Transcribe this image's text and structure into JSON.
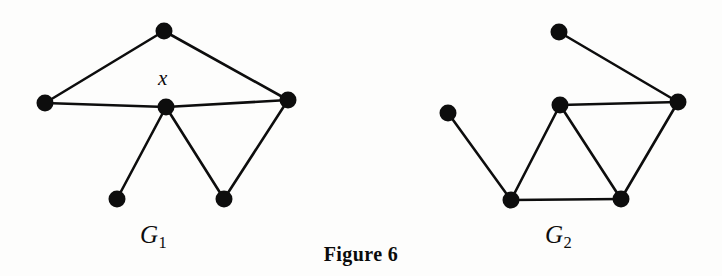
{
  "figure": {
    "caption": "Figure 6",
    "background_color": "#fdfdfc",
    "ink_color": "#0d0d0d",
    "width": 722,
    "height": 276
  },
  "graphs": [
    {
      "id": "G1",
      "label": "G",
      "label_subscript": "1",
      "label_x": 140,
      "label_y": 222,
      "vertex_radius": 8.5,
      "edge_width": 2.6,
      "vertices": [
        {
          "id": "g1-top",
          "name": "top-vertex",
          "x": 164,
          "y": 31,
          "label": ""
        },
        {
          "id": "g1-left",
          "name": "left-vertex",
          "x": 45,
          "y": 103,
          "label": ""
        },
        {
          "id": "g1-center",
          "name": "center-vertex-x",
          "x": 166,
          "y": 107,
          "label": "x"
        },
        {
          "id": "g1-right",
          "name": "right-vertex",
          "x": 288,
          "y": 100,
          "label": ""
        },
        {
          "id": "g1-bottom-left",
          "name": "bottom-left-vertex",
          "x": 117,
          "y": 199,
          "label": ""
        },
        {
          "id": "g1-bottom-right",
          "name": "bottom-right-vertex",
          "x": 224,
          "y": 199,
          "label": ""
        }
      ],
      "edges": [
        {
          "from": "g1-top",
          "to": "g1-left"
        },
        {
          "from": "g1-top",
          "to": "g1-right"
        },
        {
          "from": "g1-left",
          "to": "g1-center"
        },
        {
          "from": "g1-center",
          "to": "g1-right"
        },
        {
          "from": "g1-center",
          "to": "g1-bottom-left"
        },
        {
          "from": "g1-center",
          "to": "g1-bottom-right"
        },
        {
          "from": "g1-right",
          "to": "g1-bottom-right"
        }
      ],
      "vertex_count": 6,
      "edge_count": 7,
      "vertex_labels": [
        {
          "text": "x",
          "x": 158,
          "y": 68,
          "font_size": 21,
          "italic": true
        }
      ]
    },
    {
      "id": "G2",
      "label": "G",
      "label_subscript": "2",
      "label_x": 545,
      "label_y": 222,
      "vertex_radius": 8.5,
      "edge_width": 2.6,
      "vertices": [
        {
          "id": "g2-top",
          "name": "top-vertex",
          "x": 559,
          "y": 32,
          "label": ""
        },
        {
          "id": "g2-left",
          "name": "left-pendant-vertex",
          "x": 448,
          "y": 113,
          "label": ""
        },
        {
          "id": "g2-mid",
          "name": "middle-vertex",
          "x": 560,
          "y": 105,
          "label": ""
        },
        {
          "id": "g2-right",
          "name": "right-vertex",
          "x": 678,
          "y": 102,
          "label": ""
        },
        {
          "id": "g2-bottom-left",
          "name": "bottom-left-vertex",
          "x": 511,
          "y": 200,
          "label": ""
        },
        {
          "id": "g2-bottom-right",
          "name": "bottom-right-vertex",
          "x": 621,
          "y": 199,
          "label": ""
        }
      ],
      "edges": [
        {
          "from": "g2-top",
          "to": "g2-right"
        },
        {
          "from": "g2-left",
          "to": "g2-bottom-left"
        },
        {
          "from": "g2-mid",
          "to": "g2-right"
        },
        {
          "from": "g2-mid",
          "to": "g2-bottom-left"
        },
        {
          "from": "g2-mid",
          "to": "g2-bottom-right"
        },
        {
          "from": "g2-right",
          "to": "g2-bottom-right"
        },
        {
          "from": "g2-bottom-left",
          "to": "g2-bottom-right"
        }
      ],
      "vertex_count": 6,
      "edge_count": 7,
      "vertex_labels": []
    }
  ]
}
